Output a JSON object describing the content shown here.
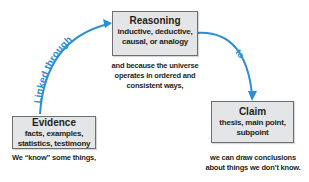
{
  "nodes": {
    "reasoning": {
      "title": "Reasoning",
      "lines": [
        "inductive, deductive,",
        "causal, or analogy"
      ]
    },
    "evidence": {
      "title": "Evidence",
      "lines": [
        "facts, examples,",
        "statistics, testimony"
      ]
    },
    "claim": {
      "title": "Claim",
      "lines": [
        "thesis, main point,",
        "subpoint"
      ]
    }
  },
  "captions": {
    "reasoning": [
      "and because the universe",
      "operates in ordered and",
      "consistent ways,"
    ],
    "evidence": [
      "We “know” some things,"
    ],
    "claim": [
      "we can draw conclusions",
      "about things we don’t know."
    ]
  },
  "edges": {
    "evidence_to_reasoning": {
      "label": "Linked through"
    },
    "reasoning_to_claim": {
      "label": "to"
    }
  },
  "colors": {
    "arrow": "#2b8fd6",
    "box_fill": "#e4e5e6",
    "box_border": "#6d6e70",
    "text": "#231f20"
  }
}
